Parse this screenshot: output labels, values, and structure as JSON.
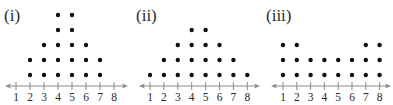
{
  "chart_data": [
    {
      "type": "dot_plot",
      "title": "(i)",
      "x": [
        1,
        2,
        3,
        4,
        5,
        6,
        7,
        8
      ],
      "counts": [
        0,
        2,
        3,
        5,
        5,
        3,
        2,
        0
      ],
      "tick_labels": [
        "1",
        "2",
        "3",
        "4",
        "5",
        "6",
        "7",
        "8"
      ],
      "xlabel": "",
      "ylabel": "",
      "grid": false
    },
    {
      "type": "dot_plot",
      "title": "(ii)",
      "x": [
        1,
        2,
        3,
        4,
        5,
        6,
        7,
        8
      ],
      "counts": [
        1,
        2,
        3,
        4,
        4,
        3,
        2,
        1
      ],
      "tick_labels": [
        "1",
        "2",
        "3",
        "4",
        "5",
        "6",
        "7",
        "8"
      ],
      "xlabel": "",
      "ylabel": "",
      "grid": false
    },
    {
      "type": "dot_plot",
      "title": "(iii)",
      "x": [
        1,
        2,
        3,
        4,
        5,
        6,
        7,
        8
      ],
      "counts": [
        3,
        3,
        2,
        2,
        2,
        2,
        3,
        3
      ],
      "tick_labels": [
        "1",
        "2",
        "3",
        "4",
        "5",
        "6",
        "7",
        "8"
      ],
      "xlabel": "",
      "ylabel": "",
      "grid": false
    }
  ],
  "panels": [
    {
      "label": "(i)",
      "label_x": 4,
      "tick1_x": 16,
      "spacing": 14,
      "axis_left": 5,
      "axis_right": 128
    },
    {
      "label": "(ii)",
      "label_x": 136,
      "tick1_x": 150,
      "spacing": 13.9,
      "axis_left": 139,
      "axis_right": 260
    },
    {
      "label": "(iii)",
      "label_x": 266,
      "tick1_x": 283,
      "spacing": 13.8,
      "axis_left": 271,
      "axis_right": 391
    }
  ],
  "colors": {
    "dot": "#111111",
    "axis": "#8a8a8a",
    "text": "#2a2a2a"
  }
}
